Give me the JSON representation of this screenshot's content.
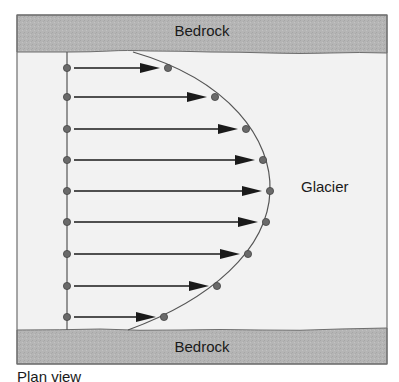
{
  "labels": {
    "bedrock_top": "Bedrock",
    "bedrock_bottom": "Bedrock",
    "glacier": "Glacier",
    "view": "Plan view"
  },
  "colors": {
    "bedrock_fill": "#b5b5b5",
    "glacier_fill": "#f2f2f2",
    "frame_stroke": "#6e6e6e",
    "arrow": "#1a1a1a",
    "dot": "#6a6a6a",
    "curve": "#555555"
  },
  "velocity_profile": {
    "reference_line_x": 67,
    "arrow_start_x": 74,
    "points": [
      {
        "y": 68,
        "end_x": 168
      },
      {
        "y": 97,
        "end_x": 215
      },
      {
        "y": 129,
        "end_x": 246
      },
      {
        "y": 160,
        "end_x": 263
      },
      {
        "y": 191,
        "end_x": 270
      },
      {
        "y": 222,
        "end_x": 266
      },
      {
        "y": 254,
        "end_x": 248
      },
      {
        "y": 286,
        "end_x": 217
      },
      {
        "y": 317,
        "end_x": 164
      }
    ]
  }
}
